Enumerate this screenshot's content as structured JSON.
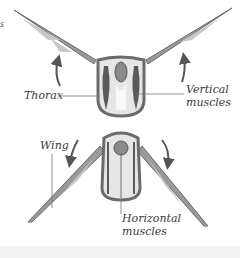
{
  "diagram": {
    "cropped_fragment": "s",
    "upper_figure": {
      "state": "wings up (upstroke)",
      "labels": {
        "thorax": "Thorax",
        "vertical_muscles_line1": "Vertical",
        "vertical_muscles_line2": "muscles"
      },
      "arrows": [
        "up-left",
        "up-right"
      ]
    },
    "lower_figure": {
      "state": "wings down (downstroke)",
      "labels": {
        "wing": "Wing",
        "horizontal_muscles_line1": "Horizontal",
        "horizontal_muscles_line2": "muscles"
      },
      "arrows": [
        "down-left",
        "down-right"
      ]
    },
    "colors": {
      "outline": "#6b6b6b",
      "muscle": "#5a5a5a",
      "fill": "#e6e6e6",
      "wing": "#8a8a8a",
      "text": "#3a3a3a",
      "leader_line": "#777777"
    }
  }
}
